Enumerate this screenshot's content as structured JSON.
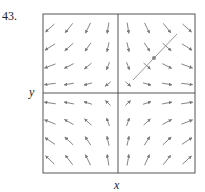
{
  "problem_number": "43.",
  "axes": {
    "x_label": "x",
    "y_label": "y"
  },
  "frame": {
    "left": 43,
    "top": 14,
    "right": 195,
    "bottom": 173,
    "axis_x": 118,
    "axis_y": 93
  },
  "colors": {
    "frame": "#555555",
    "arrow": "#777777",
    "curve": "#999999",
    "text": "#222222"
  },
  "field": {
    "description": "vector field plot (saddle-like: F = (x, -y))",
    "grid_cols": [
      50,
      69,
      88,
      108,
      128,
      147,
      167,
      187
    ],
    "grid_rows": [
      28,
      47,
      66,
      84,
      103,
      122,
      141,
      160
    ]
  },
  "solution_curve": {
    "x1": 133,
    "y1": 80,
    "x2": 177,
    "y2": 34,
    "point": {
      "x": 154,
      "y": 58
    }
  }
}
